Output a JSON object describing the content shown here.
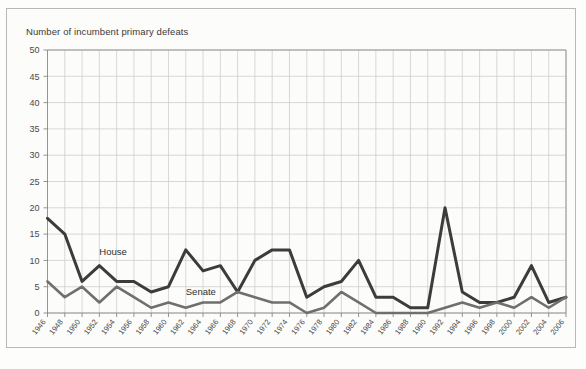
{
  "figure": {
    "title": "Number of incumbent primary defeats"
  },
  "labels": {
    "house": "House",
    "senate": "Senate"
  },
  "colors": {
    "house_line": "#3c3c3c",
    "senate_line": "#6f6f6f",
    "grid": "#c9c9c4",
    "axis": "#8d8d88",
    "text": "#3a3a3a",
    "plot_background": "#fcfcfa",
    "page_background": "#ffffff"
  },
  "chart_data": {
    "type": "line",
    "title": "Number of incumbent primary defeats",
    "xlabel": "",
    "ylabel": "Number of incumbent primary defeats",
    "ylim": [
      0,
      50
    ],
    "ytick_step": 5,
    "yticks": [
      0,
      5,
      10,
      15,
      20,
      25,
      30,
      35,
      40,
      45,
      50
    ],
    "grid": true,
    "legend": "inline-annotations",
    "categories": [
      "1946",
      "1948",
      "1950",
      "1952",
      "1954",
      "1956",
      "1958",
      "1960",
      "1962",
      "1964",
      "1966",
      "1968",
      "1970",
      "1972",
      "1974",
      "1976",
      "1978",
      "1980",
      "1982",
      "1984",
      "1986",
      "1988",
      "1990",
      "1992",
      "1994",
      "1996",
      "1998",
      "2000",
      "2002",
      "2004",
      "2006"
    ],
    "x": [
      1946,
      1948,
      1950,
      1952,
      1954,
      1956,
      1958,
      1960,
      1962,
      1964,
      1966,
      1968,
      1970,
      1972,
      1974,
      1976,
      1978,
      1980,
      1982,
      1984,
      1986,
      1988,
      1990,
      1992,
      1994,
      1996,
      1998,
      2000,
      2002,
      2004,
      2006
    ],
    "series": [
      {
        "name": "House",
        "color": "#3c3c3c",
        "values": [
          18,
          15,
          6,
          9,
          6,
          6,
          4,
          5,
          12,
          8,
          9,
          4,
          10,
          12,
          12,
          3,
          5,
          6,
          10,
          3,
          3,
          1,
          1,
          20,
          4,
          2,
          2,
          3,
          9,
          2,
          3
        ]
      },
      {
        "name": "Senate",
        "color": "#6f6f6f",
        "values": [
          6,
          3,
          5,
          2,
          5,
          3,
          1,
          2,
          1,
          2,
          2,
          4,
          3,
          2,
          2,
          0,
          1,
          4,
          2,
          0,
          0,
          0,
          0,
          1,
          2,
          1,
          2,
          1,
          3,
          1,
          3
        ]
      }
    ],
    "annotations": [
      {
        "text": "House",
        "x": 1952,
        "y": 11
      },
      {
        "text": "Senate",
        "x": 1962,
        "y": 3.4
      }
    ]
  }
}
